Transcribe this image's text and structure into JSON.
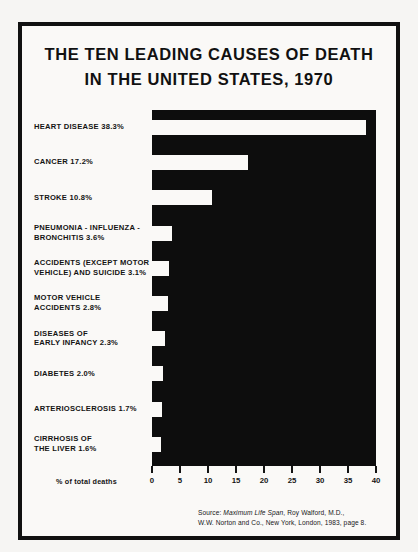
{
  "figure": {
    "title_line_1": "THE TEN LEADING CAUSES OF DEATH",
    "title_line_2": "IN THE UNITED STATES, 1970",
    "axis_title": "% of total deaths",
    "source": {
      "prefix": "Source: ",
      "book_title": "Maximum Life Span",
      "author": ", Roy Walford, M.D.,",
      "line_2": "W.W. Norton and Co., New York, London, 1983, page 8."
    },
    "colors": {
      "ink": "#111111",
      "paper": "#faf9f7",
      "plot_field": "#0d0d0d",
      "bar": "#faf9f7"
    }
  },
  "chart_data": {
    "type": "bar",
    "orientation": "horizontal",
    "title": "THE TEN LEADING CAUSES OF DEATH IN THE UNITED STATES, 1970",
    "xlabel": "% of total deaths",
    "ylabel": "",
    "xlim": [
      0,
      40
    ],
    "xticks": [
      0,
      5,
      10,
      15,
      20,
      25,
      30,
      35,
      40
    ],
    "xtick_labels": [
      "0",
      "5",
      "10",
      "15",
      "20",
      "25",
      "30",
      "35",
      "40"
    ],
    "grid": false,
    "legend": false,
    "note": "Plot field is solid black; bars are rendered as white negative space.",
    "categories": [
      "HEART DISEASE",
      "CANCER",
      "STROKE",
      "PNEUMONIA - INFLUENZA - BRONCHITIS",
      "ACCIDENTS (EXCEPT MOTOR VEHICLE) AND SUICIDE",
      "MOTOR VEHICLE ACCIDENTS",
      "DISEASES OF EARLY INFANCY",
      "DIABETES",
      "ARTERIOSCLEROSIS",
      "CIRRHOSIS OF THE LIVER"
    ],
    "values": [
      38.3,
      17.2,
      10.8,
      3.6,
      3.1,
      2.8,
      2.3,
      2.0,
      1.7,
      1.6
    ],
    "bars": [
      {
        "label_lines": [
          "HEART DISEASE 38.3%"
        ],
        "value": 38.3
      },
      {
        "label_lines": [
          "CANCER 17.2%"
        ],
        "value": 17.2
      },
      {
        "label_lines": [
          "STROKE 10.8%"
        ],
        "value": 10.8
      },
      {
        "label_lines": [
          "PNEUMONIA - INFLUENZA -",
          "BRONCHITIS 3.6%"
        ],
        "value": 3.6
      },
      {
        "label_lines": [
          "ACCIDENTS (EXCEPT MOTOR",
          "VEHICLE) AND SUICIDE 3.1%"
        ],
        "value": 3.1
      },
      {
        "label_lines": [
          "MOTOR VEHICLE",
          "ACCIDENTS 2.8%"
        ],
        "value": 2.8
      },
      {
        "label_lines": [
          "DISEASES OF",
          "EARLY INFANCY 2.3%"
        ],
        "value": 2.3
      },
      {
        "label_lines": [
          "DIABETES 2.0%"
        ],
        "value": 2.0
      },
      {
        "label_lines": [
          "ARTERIOSCLEROSIS 1.7%"
        ],
        "value": 1.7
      },
      {
        "label_lines": [
          "CIRRHOSIS OF",
          "THE LIVER 1.6%"
        ],
        "value": 1.6
      }
    ]
  }
}
